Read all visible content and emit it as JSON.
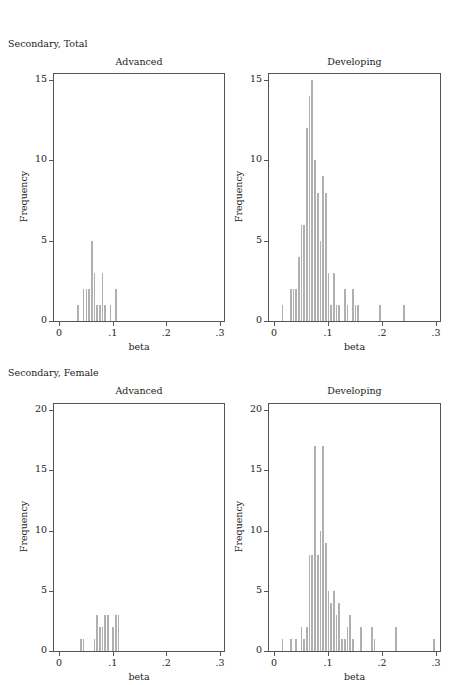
{
  "sections": [
    {
      "title": "Secondary, Total"
    },
    {
      "title": "Secondary, Female"
    }
  ],
  "chart_data": [
    {
      "type": "bar",
      "section": "Secondary, Total",
      "title": "Advanced",
      "xlabel": "beta",
      "ylabel": "Frequency",
      "xlim": [
        0,
        0.3
      ],
      "ylim": [
        0,
        15
      ],
      "xticks": [
        "0",
        ".1",
        ".2",
        ".3"
      ],
      "yticks": [
        "0",
        "5",
        "10",
        "15"
      ],
      "bin_width": 0.005,
      "bins": [
        {
          "x": 0.035,
          "count": 1
        },
        {
          "x": 0.045,
          "count": 2
        },
        {
          "x": 0.05,
          "count": 2
        },
        {
          "x": 0.055,
          "count": 2
        },
        {
          "x": 0.06,
          "count": 5
        },
        {
          "x": 0.065,
          "count": 3
        },
        {
          "x": 0.07,
          "count": 1
        },
        {
          "x": 0.075,
          "count": 1
        },
        {
          "x": 0.08,
          "count": 3
        },
        {
          "x": 0.085,
          "count": 1
        },
        {
          "x": 0.095,
          "count": 1
        },
        {
          "x": 0.105,
          "count": 2
        }
      ]
    },
    {
      "type": "bar",
      "section": "Secondary, Total",
      "title": "Developing",
      "xlabel": "beta",
      "ylabel": "Frequency",
      "xlim": [
        0,
        0.3
      ],
      "ylim": [
        0,
        15
      ],
      "xticks": [
        "0",
        ".1",
        ".2",
        ".3"
      ],
      "yticks": [
        "0",
        "5",
        "10",
        "15"
      ],
      "bin_width": 0.005,
      "bins": [
        {
          "x": 0.015,
          "count": 1
        },
        {
          "x": 0.03,
          "count": 2
        },
        {
          "x": 0.035,
          "count": 2
        },
        {
          "x": 0.04,
          "count": 2
        },
        {
          "x": 0.045,
          "count": 4
        },
        {
          "x": 0.05,
          "count": 6
        },
        {
          "x": 0.055,
          "count": 6
        },
        {
          "x": 0.06,
          "count": 12
        },
        {
          "x": 0.065,
          "count": 14
        },
        {
          "x": 0.07,
          "count": 15
        },
        {
          "x": 0.075,
          "count": 10
        },
        {
          "x": 0.08,
          "count": 8
        },
        {
          "x": 0.085,
          "count": 5
        },
        {
          "x": 0.09,
          "count": 9
        },
        {
          "x": 0.095,
          "count": 8
        },
        {
          "x": 0.1,
          "count": 3
        },
        {
          "x": 0.105,
          "count": 1
        },
        {
          "x": 0.11,
          "count": 3
        },
        {
          "x": 0.115,
          "count": 1
        },
        {
          "x": 0.12,
          "count": 1
        },
        {
          "x": 0.13,
          "count": 2
        },
        {
          "x": 0.135,
          "count": 1
        },
        {
          "x": 0.145,
          "count": 2
        },
        {
          "x": 0.15,
          "count": 1
        },
        {
          "x": 0.155,
          "count": 1
        },
        {
          "x": 0.195,
          "count": 1
        },
        {
          "x": 0.24,
          "count": 1
        }
      ]
    },
    {
      "type": "bar",
      "section": "Secondary, Female",
      "title": "Advanced",
      "xlabel": "beta",
      "ylabel": "Frequency",
      "xlim": [
        0,
        0.3
      ],
      "ylim": [
        0,
        20
      ],
      "xticks": [
        "0",
        ".1",
        ".2",
        ".3"
      ],
      "yticks": [
        "0",
        "5",
        "10",
        "15",
        "20"
      ],
      "bin_width": 0.005,
      "bins": [
        {
          "x": 0.04,
          "count": 1
        },
        {
          "x": 0.045,
          "count": 1
        },
        {
          "x": 0.065,
          "count": 1
        },
        {
          "x": 0.07,
          "count": 3
        },
        {
          "x": 0.075,
          "count": 2
        },
        {
          "x": 0.08,
          "count": 2
        },
        {
          "x": 0.085,
          "count": 3
        },
        {
          "x": 0.09,
          "count": 3
        },
        {
          "x": 0.1,
          "count": 2
        },
        {
          "x": 0.105,
          "count": 3
        },
        {
          "x": 0.11,
          "count": 3
        }
      ]
    },
    {
      "type": "bar",
      "section": "Secondary, Female",
      "title": "Developing",
      "xlabel": "beta",
      "ylabel": "Frequency",
      "xlim": [
        0,
        0.3
      ],
      "ylim": [
        0,
        20
      ],
      "xticks": [
        "0",
        ".1",
        ".2",
        ".3"
      ],
      "yticks": [
        "0",
        "5",
        "10",
        "15",
        "20"
      ],
      "bin_width": 0.005,
      "bins": [
        {
          "x": 0.015,
          "count": 1
        },
        {
          "x": 0.03,
          "count": 1
        },
        {
          "x": 0.04,
          "count": 1
        },
        {
          "x": 0.05,
          "count": 2
        },
        {
          "x": 0.055,
          "count": 1
        },
        {
          "x": 0.06,
          "count": 2
        },
        {
          "x": 0.065,
          "count": 8
        },
        {
          "x": 0.07,
          "count": 8
        },
        {
          "x": 0.075,
          "count": 17
        },
        {
          "x": 0.08,
          "count": 8
        },
        {
          "x": 0.085,
          "count": 10
        },
        {
          "x": 0.09,
          "count": 17
        },
        {
          "x": 0.095,
          "count": 9
        },
        {
          "x": 0.1,
          "count": 5
        },
        {
          "x": 0.105,
          "count": 4
        },
        {
          "x": 0.11,
          "count": 5
        },
        {
          "x": 0.115,
          "count": 3
        },
        {
          "x": 0.12,
          "count": 4
        },
        {
          "x": 0.125,
          "count": 1
        },
        {
          "x": 0.13,
          "count": 1
        },
        {
          "x": 0.135,
          "count": 2
        },
        {
          "x": 0.14,
          "count": 3
        },
        {
          "x": 0.145,
          "count": 1
        },
        {
          "x": 0.16,
          "count": 2
        },
        {
          "x": 0.18,
          "count": 2
        },
        {
          "x": 0.185,
          "count": 1
        },
        {
          "x": 0.225,
          "count": 2
        },
        {
          "x": 0.295,
          "count": 1
        }
      ]
    }
  ],
  "colors": {
    "bar": "#b0b0b0",
    "frame": "#555555",
    "text": "#222222"
  }
}
